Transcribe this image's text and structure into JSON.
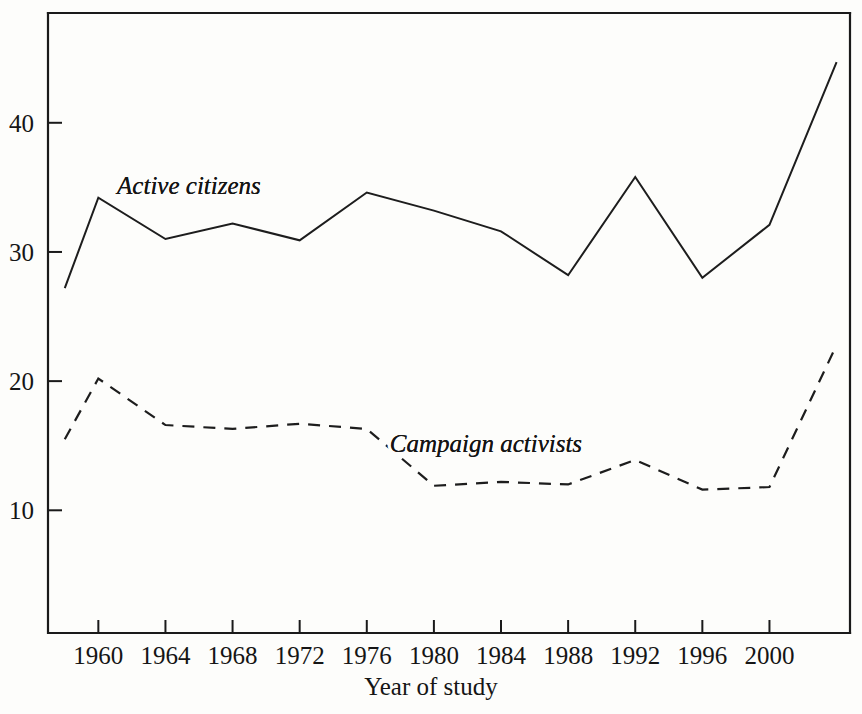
{
  "chart_data": {
    "type": "line",
    "title": "",
    "subtitle": "",
    "xlabel": "Year of study",
    "ylabel": "",
    "x": [
      1958,
      1960,
      1964,
      1968,
      1972,
      1976,
      1980,
      1984,
      1988,
      1992,
      1996,
      2000,
      2004
    ],
    "xtick_labels": [
      "1960",
      "1964",
      "1968",
      "1972",
      "1976",
      "1980",
      "1984",
      "1988",
      "1992",
      "1996",
      "2000"
    ],
    "xtick_values": [
      1960,
      1964,
      1968,
      1972,
      1976,
      1980,
      1984,
      1988,
      1992,
      1996,
      2000
    ],
    "ytick_labels": [
      "10",
      "20",
      "30",
      "40"
    ],
    "ytick_values": [
      10,
      20,
      30,
      40
    ],
    "xlim": [
      1957.0,
      2004.8
    ],
    "ylim": [
      0.5,
      48.5
    ],
    "grid": false,
    "legend_position": "inline-annotation",
    "series": [
      {
        "name": "Active citizens",
        "style": "solid",
        "color": "#1d1d1d",
        "label_x": 1965.4,
        "label_y": 34.5,
        "values": [
          27.2,
          34.2,
          31.0,
          32.2,
          30.9,
          34.6,
          33.2,
          31.6,
          28.2,
          35.8,
          28.0,
          32.1,
          44.7
        ]
      },
      {
        "name": "Campaign activists",
        "style": "dashed",
        "color": "#1d1d1d",
        "label_x": 1983.1,
        "label_y": 14.5,
        "values": [
          15.5,
          20.2,
          16.6,
          16.3,
          16.7,
          16.3,
          11.9,
          12.2,
          12.0,
          13.9,
          11.6,
          11.8,
          22.8
        ]
      }
    ]
  }
}
